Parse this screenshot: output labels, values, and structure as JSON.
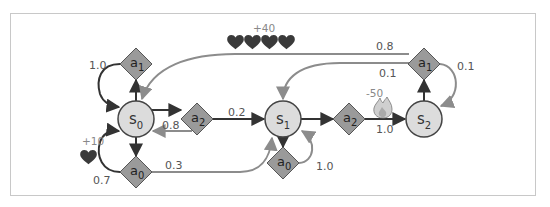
{
  "diagram": {
    "type": "markov-decision-process",
    "colors": {
      "state_fill": "#dcdcdc",
      "state_stroke": "#444444",
      "action_fill": "#9a9a9a",
      "action_stroke": "#555555",
      "dark_arrow": "#333333",
      "gray_arrow": "#8c8c8c",
      "heart": "#3a3a3a",
      "frame": "#c8c8c8"
    },
    "states": [
      {
        "id": "s0",
        "base": "s",
        "sub": "0"
      },
      {
        "id": "s1",
        "base": "s",
        "sub": "1"
      },
      {
        "id": "s2",
        "base": "s",
        "sub": "2"
      }
    ],
    "actions": [
      {
        "id": "s0_a1",
        "state": "s0",
        "base": "a",
        "sub": "1"
      },
      {
        "id": "s0_a2",
        "state": "s0",
        "base": "a",
        "sub": "2"
      },
      {
        "id": "s0_a0",
        "state": "s0",
        "base": "a",
        "sub": "0"
      },
      {
        "id": "s1_a2",
        "state": "s1",
        "base": "a",
        "sub": "2"
      },
      {
        "id": "s1_a0",
        "state": "s1",
        "base": "a",
        "sub": "0"
      },
      {
        "id": "s2_a1",
        "state": "s2",
        "base": "a",
        "sub": "1"
      }
    ],
    "transitions": [
      {
        "from": "s0_a1",
        "to": "s0",
        "prob": "1.0"
      },
      {
        "from": "s0_a2",
        "to": "s0",
        "prob": "0.8"
      },
      {
        "from": "s0_a2",
        "to": "s1",
        "prob": "0.2"
      },
      {
        "from": "s0_a0",
        "to": "s0",
        "prob": "0.7",
        "reward": "+10"
      },
      {
        "from": "s0_a0",
        "to": "s1",
        "prob": "0.3"
      },
      {
        "from": "s1_a0",
        "to": "s1",
        "prob": "1.0"
      },
      {
        "from": "s1_a2",
        "to": "s2",
        "prob": "1.0",
        "reward": "-50"
      },
      {
        "from": "s2_a1",
        "to": "s0",
        "prob": "0.8",
        "reward": "+40"
      },
      {
        "from": "s2_a1",
        "to": "s1",
        "prob": "0.1"
      },
      {
        "from": "s2_a1",
        "to": "s2",
        "prob": "0.1"
      }
    ],
    "labels": {
      "p_s0a1_s0": "1.0",
      "p_s0a2_s0": "0.8",
      "p_s0a2_s1": "0.2",
      "p_s0a0_s0": "0.7",
      "p_s0a0_s1": "0.3",
      "p_s1a0_s1": "1.0",
      "p_s1a2_s2": "1.0",
      "p_s2a1_s0": "0.8",
      "p_s2a1_s1": "0.1",
      "p_s2a1_s2": "0.1",
      "r_s0a0": "+10",
      "r_s2a1_s0": "+40",
      "r_s1a2": "-50"
    },
    "icons": {
      "reward_positive": "heart-icon",
      "reward_negative": "fire-icon"
    }
  }
}
